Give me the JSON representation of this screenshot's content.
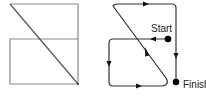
{
  "figures": [
    {
      "name": "figure-left-shape",
      "description": "Rectangle split horizontally with a diagonal line"
    },
    {
      "name": "figure-right-path",
      "description": "Traversal path with arrows from Start to Finish",
      "labels": {
        "start": "Start",
        "finish": "Finish"
      }
    }
  ],
  "colors": {
    "line_left": "#8a8a8a",
    "line_right": "#333333",
    "marker": "#000000",
    "background": "#ffffff"
  }
}
